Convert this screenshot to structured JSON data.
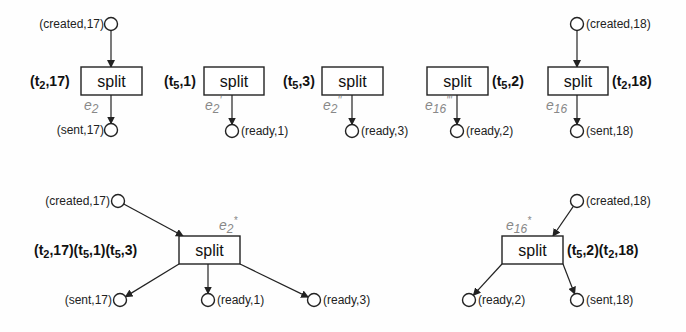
{
  "diagram": {
    "title": "",
    "top_row": [
      {
        "id": "n1",
        "transition": "split",
        "box": [
          81,
          67,
          61,
          28
        ],
        "binding": {
          "text": "(t2,17)",
          "x": 30,
          "y": 86,
          "anchor": "start"
        },
        "event": {
          "text": "e2",
          "x": 84,
          "y": 110
        },
        "inputs": [
          {
            "label": "(created,17)",
            "cx": 111,
            "cy": 24,
            "lx": 104,
            "ly": 28,
            "anchor": "end"
          }
        ],
        "outputs": [
          {
            "label": "(sent,17)",
            "cx": 111,
            "cy": 130,
            "lx": 104,
            "ly": 134,
            "anchor": "end"
          }
        ]
      },
      {
        "id": "n2",
        "transition": "split",
        "box": [
          204,
          67,
          60,
          28
        ],
        "binding": {
          "text": "(t5,1)",
          "x": 164,
          "y": 86,
          "anchor": "start"
        },
        "event": {
          "text": "e2'",
          "x": 205,
          "y": 110
        },
        "inputs": [],
        "outputs": [
          {
            "label": "(ready,1)",
            "cx": 232,
            "cy": 131,
            "lx": 241,
            "ly": 135,
            "anchor": "start"
          }
        ]
      },
      {
        "id": "n3",
        "transition": "split",
        "box": [
          322,
          67,
          61,
          28
        ],
        "binding": {
          "text": "(t5,3)",
          "x": 283,
          "y": 86,
          "anchor": "start"
        },
        "event": {
          "text": "e2''",
          "x": 323,
          "y": 110
        },
        "inputs": [],
        "outputs": [
          {
            "label": "(ready,3)",
            "cx": 352,
            "cy": 131,
            "lx": 361,
            "ly": 135,
            "anchor": "start"
          }
        ]
      },
      {
        "id": "n4",
        "transition": "split",
        "box": [
          427,
          67,
          61,
          28
        ],
        "binding": {
          "text": "(t5,2)",
          "x": 492,
          "y": 86,
          "anchor": "start"
        },
        "event": {
          "text": "e16'''",
          "x": 425,
          "y": 110
        },
        "inputs": [],
        "outputs": [
          {
            "label": "(ready,2)",
            "cx": 457,
            "cy": 131,
            "lx": 466,
            "ly": 135,
            "anchor": "start"
          }
        ]
      },
      {
        "id": "n5",
        "transition": "split",
        "box": [
          548,
          67,
          60,
          28
        ],
        "binding": {
          "text": "(t2,18)",
          "x": 612,
          "y": 86,
          "anchor": "start"
        },
        "event": {
          "text": "e16",
          "x": 546,
          "y": 110
        },
        "inputs": [
          {
            "label": "(created,18)",
            "cx": 577,
            "cy": 24,
            "lx": 586,
            "ly": 28,
            "anchor": "start"
          }
        ],
        "outputs": [
          {
            "label": "(sent,18)",
            "cx": 577,
            "cy": 131,
            "lx": 586,
            "ly": 135,
            "anchor": "start"
          }
        ]
      }
    ],
    "bottom_row": [
      {
        "id": "m1",
        "transition": "split",
        "box": [
          179,
          236,
          61,
          28
        ],
        "binding": {
          "text": "(t2,17)(t5,1)(t5,3)",
          "x": 34,
          "y": 255,
          "anchor": "start"
        },
        "event": {
          "text": "e2*",
          "x": 219,
          "y": 230
        },
        "inputs": [
          {
            "label": "(created,17)",
            "cx": 118,
            "cy": 201,
            "lx": 110,
            "ly": 205,
            "anchor": "end"
          }
        ],
        "outputs": [
          {
            "label": "(sent,17)",
            "cx": 120,
            "cy": 300,
            "lx": 112,
            "ly": 304,
            "anchor": "end"
          },
          {
            "label": "(ready,1)",
            "cx": 208,
            "cy": 300,
            "lx": 217,
            "ly": 304,
            "anchor": "start"
          },
          {
            "label": "(ready,3)",
            "cx": 314,
            "cy": 300,
            "lx": 323,
            "ly": 304,
            "anchor": "start"
          }
        ]
      },
      {
        "id": "m2",
        "transition": "split",
        "box": [
          502,
          236,
          61,
          28
        ],
        "binding": {
          "text": "(t5,2)(t2,18)",
          "x": 567,
          "y": 255,
          "anchor": "start"
        },
        "event": {
          "text": "e16*",
          "x": 506,
          "y": 230
        },
        "inputs": [
          {
            "label": "(created,18)",
            "cx": 577,
            "cy": 201,
            "lx": 586,
            "ly": 205,
            "anchor": "start"
          }
        ],
        "outputs": [
          {
            "label": "(ready,2)",
            "cx": 469,
            "cy": 300,
            "lx": 478,
            "ly": 304,
            "anchor": "start"
          },
          {
            "label": "(sent,18)",
            "cx": 577,
            "cy": 300,
            "lx": 586,
            "ly": 304,
            "anchor": "start"
          }
        ]
      }
    ]
  }
}
